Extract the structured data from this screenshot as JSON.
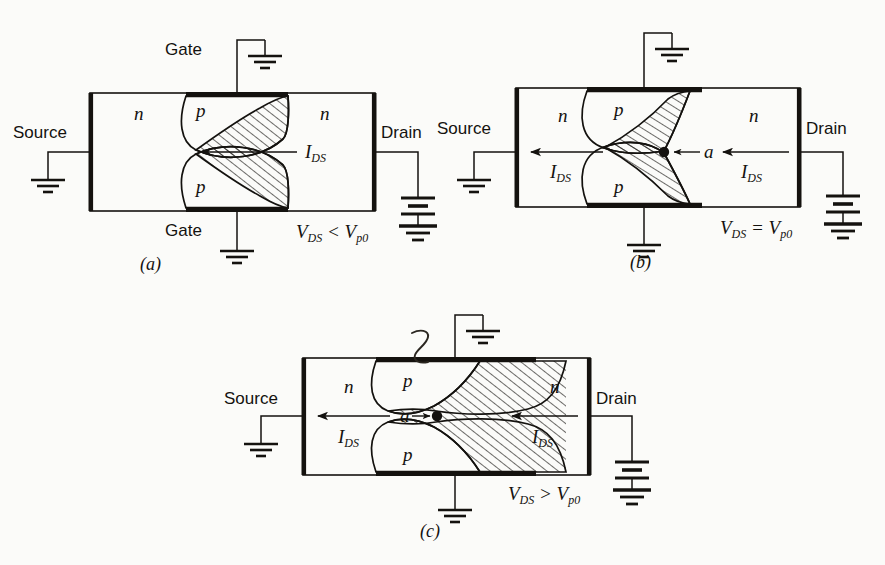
{
  "figure": {
    "ink_color": "#14120f",
    "paper_color": "#fbfbf9",
    "hatch_color": "#14120f"
  },
  "panels": [
    {
      "id": "a",
      "caption": "(a)",
      "terminals": {
        "source": "Source",
        "drain": "Drain",
        "gate_top": "Gate",
        "gate_bottom": "Gate"
      },
      "regions": {
        "n_left": "n",
        "n_right": "n",
        "p_top": "p",
        "p_bottom": "p"
      },
      "current_labels": [
        "I",
        "DS"
      ],
      "current_label_text": "I_DS",
      "bias": {
        "lead": "V",
        "lead_sub": "DS",
        "relation": "<",
        "ref": "V",
        "ref_sub": "p0"
      },
      "bias_text": "V_DS < V_p0",
      "pinch_point": false,
      "channel_gap_label": null
    },
    {
      "id": "b",
      "caption": "(b)",
      "terminals": {
        "source": "Source",
        "drain": "Drain",
        "gate_top": "",
        "gate_bottom": ""
      },
      "regions": {
        "n_left": "n",
        "n_right": "n",
        "p_top": "p",
        "p_bottom": "p"
      },
      "current_labels": [
        "I",
        "DS"
      ],
      "current_label_text": "I_DS",
      "bias": {
        "lead": "V",
        "lead_sub": "DS",
        "relation": "=",
        "ref": "V",
        "ref_sub": "p0"
      },
      "bias_text": "V_DS = V_p0",
      "pinch_point": true,
      "channel_gap_label": "a"
    },
    {
      "id": "c",
      "caption": "(c)",
      "terminals": {
        "source": "Source",
        "drain": "Drain",
        "gate_top": "",
        "gate_bottom": ""
      },
      "regions": {
        "n_left": "n",
        "n_right": "n",
        "p_top": "p",
        "p_bottom": "p"
      },
      "current_labels": [
        "I",
        "DS"
      ],
      "current_label_text": "I_DS",
      "bias": {
        "lead": "V",
        "lead_sub": "DS",
        "relation": ">",
        "ref": "V",
        "ref_sub": "p0"
      },
      "bias_text": "V_DS > V_p0",
      "pinch_point": true,
      "channel_gap_label": "a",
      "annotation_mark": "handwritten-zeta"
    }
  ],
  "symbols": {
    "ground": "ground-symbol",
    "battery": "battery-symbol",
    "arrow": "current-arrow"
  }
}
